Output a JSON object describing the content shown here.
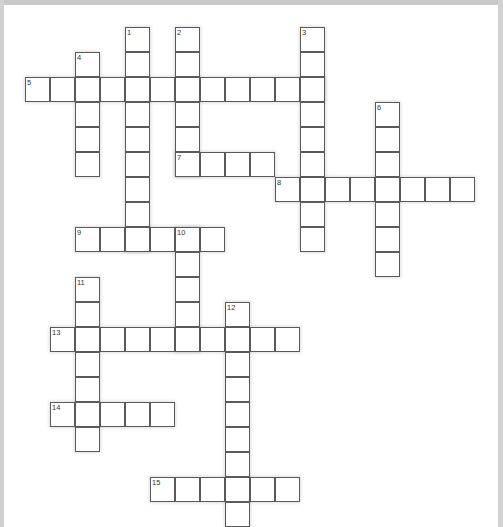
{
  "page": {
    "type": "crossword-grid",
    "width": 503,
    "height": 527,
    "background_color": "#ffffff",
    "frame_color": "#cccccc"
  },
  "grid": {
    "cell_size": 25,
    "origin_x": 25,
    "origin_y": 27,
    "cell_fill": "#ffffff",
    "cell_border_color": "#5a5a5a",
    "number_color": "#333333",
    "columns": 19,
    "rows": 20
  },
  "entries": [
    {
      "number": "1",
      "direction": "down",
      "col": 4,
      "row": 0,
      "length": 9
    },
    {
      "number": "2",
      "direction": "down",
      "col": 6,
      "row": 0,
      "length": 6
    },
    {
      "number": "3",
      "direction": "down",
      "col": 11,
      "row": 0,
      "length": 9
    },
    {
      "number": "4",
      "direction": "down",
      "col": 2,
      "row": 1,
      "length": 5
    },
    {
      "number": "5",
      "direction": "across",
      "col": 0,
      "row": 2,
      "length": 12
    },
    {
      "number": "6",
      "direction": "down",
      "col": 14,
      "row": 3,
      "length": 7
    },
    {
      "number": "7",
      "direction": "across",
      "col": 6,
      "row": 5,
      "length": 4
    },
    {
      "number": "8",
      "direction": "across",
      "col": 10,
      "row": 6,
      "length": 8
    },
    {
      "number": "9",
      "direction": "across",
      "col": 2,
      "row": 8,
      "length": 6
    },
    {
      "number": "10",
      "direction": "down",
      "col": 6,
      "row": 8,
      "length": 5
    },
    {
      "number": "11",
      "direction": "down",
      "col": 2,
      "row": 10,
      "length": 7
    },
    {
      "number": "12",
      "direction": "down",
      "col": 8,
      "row": 11,
      "length": 9
    },
    {
      "number": "13",
      "direction": "across",
      "col": 1,
      "row": 12,
      "length": 10
    },
    {
      "number": "14",
      "direction": "across",
      "col": 1,
      "row": 15,
      "length": 5
    },
    {
      "number": "15",
      "direction": "across",
      "col": 5,
      "row": 18,
      "length": 6
    }
  ],
  "numbers_visible": [
    "1",
    "2",
    "3",
    "4",
    "5",
    "6",
    "7",
    "8",
    "9",
    "10",
    "11",
    "12",
    "13",
    "14",
    "15"
  ]
}
